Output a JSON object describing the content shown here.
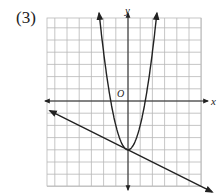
{
  "problem_label": "(3)",
  "chart_data": {
    "type": "line",
    "title": "",
    "xlabel": "x",
    "ylabel": "y",
    "origin_label": "O",
    "grid": true,
    "xlim": [
      -6.5,
      6
    ],
    "ylim": [
      -7,
      7
    ],
    "series": [
      {
        "name": "parabola",
        "equation": "y = 2x^2 - 4",
        "vertex": [
          0,
          -4
        ],
        "arrow_ends": true
      },
      {
        "name": "line",
        "equation": "y = -0.5x - 4",
        "slope": -0.5,
        "y_intercept": -4,
        "arrow_ends": true
      }
    ],
    "intersection": [
      0,
      -4
    ]
  }
}
